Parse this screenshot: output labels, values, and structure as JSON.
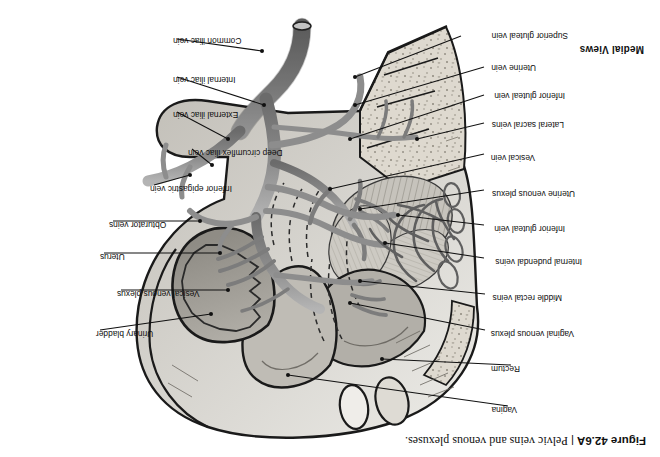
{
  "figure": {
    "number": "Figure 42.6A",
    "separator": "|",
    "caption": "Pelvic veins and venous plexuses.",
    "views_header": "Medial Views",
    "orientation_deg": 180
  },
  "palette": {
    "page_background": "#ffffff",
    "ink": "#111111",
    "outline": "#1a1a1a",
    "vessel_fill": "#8d8d8d",
    "vessel_shadow": "#6f6f6f",
    "vessel_highlight": "#b9b9b9",
    "organ_light": "#e3e0da",
    "organ_mid": "#c9c6bf",
    "organ_dark": "#9e9b94",
    "bone_fill": "#ded9cf",
    "bone_speckle": "#8e897e",
    "muscle_hatch": "#bdbab3",
    "bladder_fill": "#a8a59e",
    "leader": "#111111"
  },
  "labels": {
    "left": [
      {
        "id": "vagina",
        "text": "Vagina",
        "tx": 143,
        "ty": 48,
        "lx": 152,
        "ly": 51,
        "ex": 372,
        "ey": 82
      },
      {
        "id": "rectum",
        "text": "Rectum",
        "tx": 140,
        "ty": 89,
        "lx": 149,
        "ly": 92,
        "ex": 278,
        "ey": 98
      },
      {
        "id": "vaginal-venous-plexus",
        "text": "Vaginal venous plexus",
        "tx": 86,
        "ty": 124,
        "lx": 175,
        "ly": 127,
        "ex": 310,
        "ey": 154
      },
      {
        "id": "middle-rectal-veins",
        "text": "Middle rectal veins",
        "tx": 98,
        "ty": 160,
        "lx": 175,
        "ly": 163,
        "ex": 300,
        "ey": 176
      },
      {
        "id": "internal-pudendal-veins",
        "text": "Internal pudendal veins",
        "tx": 78,
        "ty": 196,
        "lx": 176,
        "ly": 199,
        "ex": 275,
        "ey": 214
      },
      {
        "id": "inferior-gluteal-vein-1",
        "text": "Inferior gluteal vein",
        "tx": 95,
        "ty": 229,
        "lx": 176,
        "ly": 232,
        "ex": 262,
        "ey": 242
      },
      {
        "id": "uterine-venous-plexus",
        "text": "Uterine venous plexus",
        "tx": 85,
        "ty": 264,
        "lx": 176,
        "ly": 267,
        "ex": 300,
        "ey": 248
      },
      {
        "id": "vesical-vein",
        "text": "Vesical vein",
        "tx": 125,
        "ty": 300,
        "lx": 176,
        "ly": 303,
        "ex": 330,
        "ey": 268
      },
      {
        "id": "lateral-sacral-veins",
        "text": "Lateral sacral veins",
        "tx": 96,
        "ty": 333,
        "lx": 176,
        "ly": 334,
        "ex": 243,
        "ey": 318
      },
      {
        "id": "inferior-gluteal-vein-2",
        "text": "Inferior gluteal vein",
        "tx": 95,
        "ty": 362,
        "lx": 176,
        "ly": 362,
        "ex": 310,
        "ey": 318
      },
      {
        "id": "uterine-vein",
        "text": "Uterine vein",
        "tx": 124,
        "ty": 390,
        "lx": 176,
        "ly": 390,
        "ex": 305,
        "ey": 352
      },
      {
        "id": "superior-gluteal-vein",
        "text": "Superior gluteal vein",
        "tx": 92,
        "ty": 422,
        "lx": 199,
        "ly": 421,
        "ex": 305,
        "ey": 380
      }
    ],
    "right": [
      {
        "id": "urinary-bladder",
        "text": "Urinary bladder",
        "tx": 564,
        "ty": 124,
        "lx": 560,
        "ly": 127,
        "ex": 449,
        "ey": 143
      },
      {
        "id": "vesical-venous-plexus",
        "text": "Vesical venous plexus",
        "tx": 543,
        "ty": 164,
        "lx": 539,
        "ly": 167,
        "ex": 432,
        "ey": 167
      },
      {
        "id": "uterus",
        "text": "Uterus",
        "tx": 560,
        "ty": 201,
        "lx": 556,
        "ly": 204,
        "ex": 440,
        "ey": 204
      },
      {
        "id": "obturator-veins",
        "text": "Obturator veins",
        "tx": 551,
        "ty": 233,
        "lx": 547,
        "ly": 236,
        "ex": 460,
        "ey": 236
      },
      {
        "id": "inferior-epigastric-vein",
        "text": "Inferior epigastric vein",
        "tx": 510,
        "ty": 269,
        "lx": 506,
        "ly": 272,
        "ex": 470,
        "ey": 282
      },
      {
        "id": "deep-circumflex-iliac-vein",
        "text": "Deep circumflex iliac vein",
        "tx": 472,
        "ty": 305,
        "lx": 468,
        "ly": 308,
        "ex": 448,
        "ey": 292
      },
      {
        "id": "external-iliac-vein",
        "text": "External iliac vein",
        "tx": 487,
        "ty": 343,
        "lx": 483,
        "ly": 345,
        "ex": 432,
        "ey": 318
      },
      {
        "id": "internal-iliac-vein",
        "text": "Internal iliac vein",
        "tx": 487,
        "ty": 378,
        "lx": 483,
        "ly": 380,
        "ex": 396,
        "ey": 352
      },
      {
        "id": "common-iliac-vein",
        "text": "Common iliac vein",
        "tx": 487,
        "ty": 417,
        "lx": 483,
        "ly": 418,
        "ex": 398,
        "ey": 406
      }
    ]
  }
}
